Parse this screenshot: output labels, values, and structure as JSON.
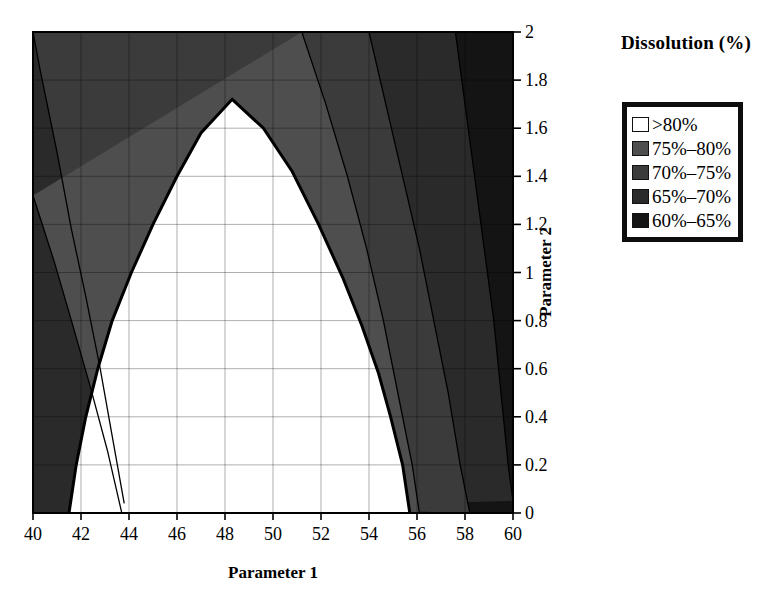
{
  "chart_data": {
    "type": "contour",
    "title": "",
    "xlabel": "Parameter 1",
    "ylabel": "Parameter 2",
    "xlim": [
      40,
      60
    ],
    "ylim": [
      0,
      2
    ],
    "xticks": [
      "40",
      "42",
      "44",
      "46",
      "48",
      "50",
      "52",
      "54",
      "56",
      "58",
      "60"
    ],
    "yticks": [
      "0",
      "0.2",
      "0.4",
      "0.6",
      "0.8",
      "1",
      "1.2",
      "1.4",
      "1.6",
      "1.8",
      "2"
    ],
    "grid": true,
    "legend_position": "right",
    "legend_title": "Dissolution (%)",
    "levels": [
      {
        "label": ">80%",
        "color": "#ffffff",
        "min": 80,
        "max": 100
      },
      {
        "label": "75%–80%",
        "color": "#4e4e4e",
        "min": 75,
        "max": 80
      },
      {
        "label": "70%–75%",
        "color": "#3b3b3b",
        "min": 70,
        "max": 75
      },
      {
        "label": "65%–70%",
        "color": "#2a2a2a",
        "min": 65,
        "max": 70
      },
      {
        "label": "60%–65%",
        "color": "#141414",
        "min": 60,
        "max": 65
      }
    ],
    "annotations": {
      "peak_region": ">80% dissolution dome centred near Parameter 1 = 48.3, extending from Parameter 2 = 0 up to 1.72",
      "left_boundary_at_y0": 41.5,
      "right_boundary_at_y0": 55.7,
      "apex": [
        48.3,
        1.72
      ]
    },
    "contours_80": [
      [
        41.5,
        0.0
      ],
      [
        41.8,
        0.2
      ],
      [
        42.2,
        0.4
      ],
      [
        42.7,
        0.6
      ],
      [
        43.3,
        0.8
      ],
      [
        44.1,
        1.0
      ],
      [
        45.0,
        1.2
      ],
      [
        46.0,
        1.4
      ],
      [
        47.0,
        1.58
      ],
      [
        48.3,
        1.72
      ],
      [
        49.6,
        1.6
      ],
      [
        50.8,
        1.42
      ],
      [
        51.9,
        1.2
      ],
      [
        52.9,
        0.98
      ],
      [
        53.7,
        0.78
      ],
      [
        54.4,
        0.58
      ],
      [
        54.9,
        0.4
      ],
      [
        55.4,
        0.2
      ],
      [
        55.7,
        0.0
      ]
    ],
    "contours_75_left": [
      [
        40.0,
        1.32
      ],
      [
        40.9,
        1.04
      ],
      [
        41.6,
        0.8
      ],
      [
        42.4,
        0.52
      ],
      [
        43.1,
        0.26
      ],
      [
        43.7,
        0.0
      ]
    ],
    "contours_70_left": [
      [
        40.0,
        2.0
      ],
      [
        40.3,
        1.84
      ],
      [
        41.0,
        1.5
      ],
      [
        41.6,
        1.18
      ],
      [
        42.2,
        0.9
      ],
      [
        42.8,
        0.6
      ],
      [
        43.3,
        0.32
      ],
      [
        43.8,
        0.04
      ]
    ],
    "contours_75_right": [
      [
        51.2,
        2.0
      ],
      [
        52.2,
        1.7
      ],
      [
        53.1,
        1.4
      ],
      [
        53.9,
        1.1
      ],
      [
        54.6,
        0.8
      ],
      [
        55.2,
        0.5
      ],
      [
        55.8,
        0.2
      ],
      [
        56.1,
        0.0
      ]
    ],
    "contours_70_right": [
      [
        54.0,
        2.0
      ],
      [
        54.7,
        1.7
      ],
      [
        55.4,
        1.4
      ],
      [
        56.1,
        1.1
      ],
      [
        56.7,
        0.8
      ],
      [
        57.3,
        0.5
      ],
      [
        57.8,
        0.2
      ],
      [
        58.2,
        0.0
      ]
    ],
    "contours_65_right": [
      [
        57.6,
        2.0
      ],
      [
        58.0,
        1.7
      ],
      [
        58.4,
        1.4
      ],
      [
        58.8,
        1.1
      ],
      [
        59.2,
        0.8
      ],
      [
        59.5,
        0.5
      ],
      [
        59.8,
        0.2
      ],
      [
        60.0,
        0.05
      ]
    ]
  },
  "legend": {
    "title": "Dissolution (%)",
    "entries": [
      {
        "label": ">80%"
      },
      {
        "label": "75%–80%"
      },
      {
        "label": "70%–75%"
      },
      {
        "label": "65%–70%"
      },
      {
        "label": "60%–65%"
      }
    ]
  },
  "axes": {
    "x_title": "Parameter 1",
    "y_title": "Parameter 2"
  }
}
